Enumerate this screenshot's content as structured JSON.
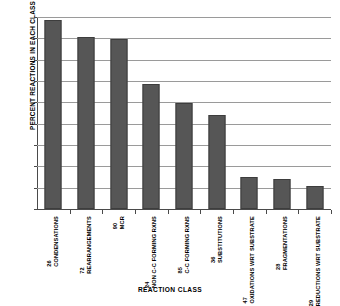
{
  "chart_data": {
    "type": "bar",
    "title": "",
    "xlabel": "REACTION CLASS",
    "ylabel": "PERCENT REACTIONS IN EACH CLASS",
    "ylim": [
      0.0,
      90.0
    ],
    "ytick_step": 10.0,
    "grid": true,
    "legend": "none",
    "categories": [
      "CONDENSATIONS",
      "REARRANGEMENTS",
      "MCR",
      "NON C-C FORMING RXNS",
      "C-C FORMING RXNS",
      "SUBSTITUTIONS",
      "OXIDATIONS WRT SUBSTRATE",
      "FRAGMENTATIONS",
      "REDUCTIONS WRT SUBSTRATE"
    ],
    "category_counts": [
      26,
      72,
      90,
      24,
      85,
      36,
      47,
      28,
      29
    ],
    "values": [
      88.5,
      80.5,
      79.7,
      58.7,
      49.7,
      44.3,
      15.1,
      14.3,
      10.7
    ],
    "ytick_labels": [
      "0.0",
      "10.0",
      "20.0",
      "30.0",
      "40.0",
      "50.0",
      "60.0",
      "70.0",
      "80.0",
      "90.0"
    ],
    "bar_color": "#565656",
    "bar_edge_color": "#3d3d3d",
    "grid_color": "#9a9a9a",
    "axis_color": "#4a4a4a"
  }
}
